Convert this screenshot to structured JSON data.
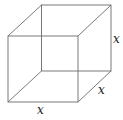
{
  "diagram": {
    "type": "wireframe-cube",
    "labels": {
      "height": "x",
      "depth": "x",
      "width": "x"
    },
    "colors": {
      "edge": "#6b6b6b",
      "label": "#222222",
      "background": "#ffffff"
    }
  }
}
